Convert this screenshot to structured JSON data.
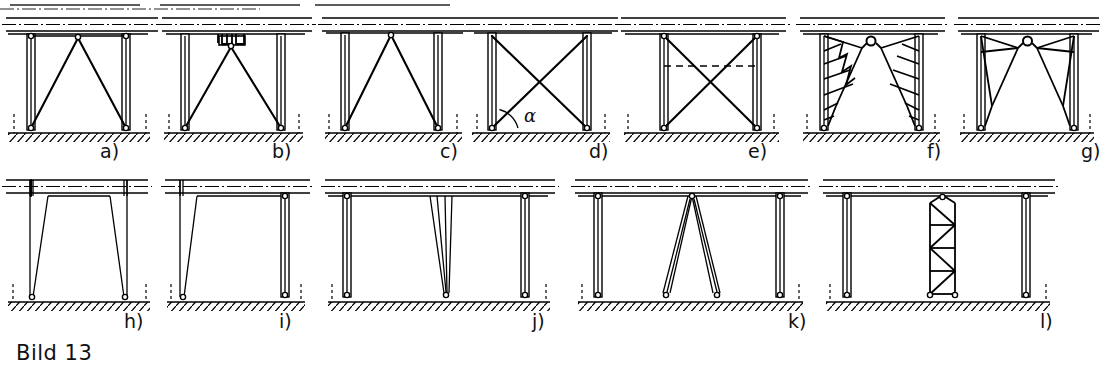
{
  "figure": {
    "caption": "Bild 13",
    "caption_label": "figure-caption",
    "width": 1103,
    "height": 373,
    "ink_color": "#000000",
    "paper_color": "#ffffff",
    "drawing_type": "engineering-line-drawing"
  },
  "angle_annotation": {
    "symbol": "α",
    "in_panel": "d",
    "description": "inclination angle of the diagonal brace measured from the foundation line"
  },
  "rows": [
    {
      "row_index": 0,
      "panels": [
        "a",
        "b",
        "c",
        "d",
        "e",
        "f",
        "g"
      ]
    },
    {
      "row_index": 1,
      "panels": [
        "h",
        "i",
        "j",
        "k",
        "l"
      ]
    }
  ],
  "panels": [
    {
      "id": "a",
      "label": "a)",
      "row": 0,
      "bracing": "single triangular diagonal pair from column bases to crown point",
      "columns": 2,
      "column_style": "double-line hollow section",
      "has_crown_node": true,
      "has_cross_beam": true,
      "hatched_foundation": true
    },
    {
      "id": "b",
      "label": "b)",
      "row": 0,
      "bracing": "triangular diagonals meeting at a bracket/gusset hung under the girder",
      "columns": 2,
      "column_style": "double-line hollow section",
      "has_crown_node": true,
      "has_bracket_detail": true,
      "hatched_foundation": true
    },
    {
      "id": "c",
      "label": "c)",
      "row": 0,
      "bracing": "narrow triangular diagonals rising to a node on the girder underside",
      "columns": 2,
      "column_style": "double-line hollow section",
      "has_crown_node": true,
      "hatched_foundation": true
    },
    {
      "id": "d",
      "label": "d)",
      "row": 0,
      "bracing": "full X cross bracing between the two columns",
      "columns": 2,
      "column_style": "double-line hollow section",
      "angle_label": "α",
      "hatched_foundation": true
    },
    {
      "id": "e",
      "label": "e)",
      "row": 0,
      "bracing": "X cross bracing with a horizontal dashed tie at the crossing level",
      "columns": 2,
      "column_style": "double-line hollow section",
      "has_dashed_tie": true,
      "hatched_foundation": true
    },
    {
      "id": "f",
      "label": "f)",
      "row": 0,
      "bracing": "tapered lattice haunches (zig-zag web) on both columns meeting at a ridge node",
      "columns": 2,
      "column_style": "double-line hollow section",
      "has_crown_node": true,
      "hatched_foundation": true
    },
    {
      "id": "g",
      "label": "g)",
      "row": 0,
      "bracing": "solid tapered knee braces (haunches) meeting at a ridge node",
      "columns": 2,
      "column_style": "double-line hollow section",
      "has_crown_node": true,
      "hatched_foundation": true
    },
    {
      "id": "h",
      "label": "h)",
      "row": 1,
      "bracing": "two inclined single columns (splayed A-form legs), no diagonals",
      "columns": 2,
      "column_style": "single thin line, inclined inward at top",
      "hatched_foundation": true
    },
    {
      "id": "i",
      "label": "i)",
      "row": 1,
      "bracing": "one inclined leg combined with one vertical hollow column",
      "columns": 2,
      "column_style": "mixed: inclined single line plus double-line hollow section",
      "hatched_foundation": true
    },
    {
      "id": "j",
      "label": "j)",
      "row": 1,
      "bracing": "two vertical edge columns plus a slender central tapered pendulum support",
      "columns": 3,
      "column_style": "double-line hollow sections",
      "hatched_foundation": true
    },
    {
      "id": "k",
      "label": "k)",
      "row": 1,
      "bracing": "two vertical edge columns plus a central A-frame (two splayed struts to one head node)",
      "columns": 4,
      "column_style": "double-line hollow sections",
      "has_crown_node": true,
      "hatched_foundation": true
    },
    {
      "id": "l",
      "label": "l)",
      "row": 1,
      "bracing": "two vertical edge columns plus a central braced lattice tower with N-type web",
      "columns": 4,
      "column_style": "double-line hollow sections, central latticed mast",
      "has_crown_node": true,
      "hatched_foundation": true
    }
  ]
}
